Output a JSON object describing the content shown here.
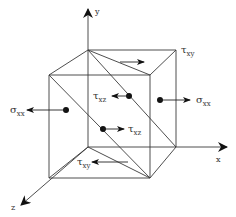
{
  "diagram": {
    "axes": {
      "x": "x",
      "y": "y",
      "z": "z"
    },
    "labels": {
      "tau_xy_top": {
        "symbol": "τ",
        "subscript": "xy"
      },
      "tau_xz_upper": {
        "symbol": "τ",
        "subscript": "xz"
      },
      "tau_xz_lower": {
        "symbol": "τ",
        "subscript": "xz"
      },
      "tau_xy_bottom": {
        "symbol": "τ",
        "subscript": "xy"
      },
      "sigma_xx_left": {
        "symbol": "σ",
        "subscript": "xx"
      },
      "sigma_xx_right": {
        "symbol": "σ",
        "subscript": "xx"
      }
    },
    "colors": {
      "line": "#3a3a3a",
      "arrow": "#111111",
      "background": "#ffffff"
    }
  }
}
